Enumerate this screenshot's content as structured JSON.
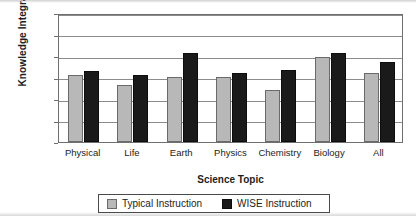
{
  "chart_data": {
    "type": "bar",
    "title": "",
    "xlabel": "Science Topic",
    "ylabel": "Knowledge Integration",
    "categories": [
      "Physical",
      "Life",
      "Earth",
      "Physics",
      "Chemistry",
      "Biology",
      "All"
    ],
    "series": [
      {
        "name": "Typical Instruction",
        "color": "#b8b8b8",
        "values": [
          1.55,
          1.32,
          1.52,
          1.52,
          1.2,
          1.97,
          1.6
        ]
      },
      {
        "name": "WISE Instruction",
        "color": "#1a1a1a",
        "values": [
          1.65,
          1.55,
          2.08,
          1.6,
          1.68,
          2.07,
          1.85
        ]
      }
    ],
    "ylim": [
      0,
      3
    ],
    "ytick_labels": [
      "0",
      "0.5",
      "1",
      "1.5",
      "2",
      "2.5",
      "3"
    ],
    "ytick_values": [
      0,
      0.5,
      1,
      1.5,
      2,
      2.5,
      3
    ],
    "grid": "horizontal",
    "legend_position": "bottom"
  },
  "legend": {
    "entries": [
      {
        "label": "Typical Instruction"
      },
      {
        "label": "WISE Instruction"
      }
    ]
  }
}
